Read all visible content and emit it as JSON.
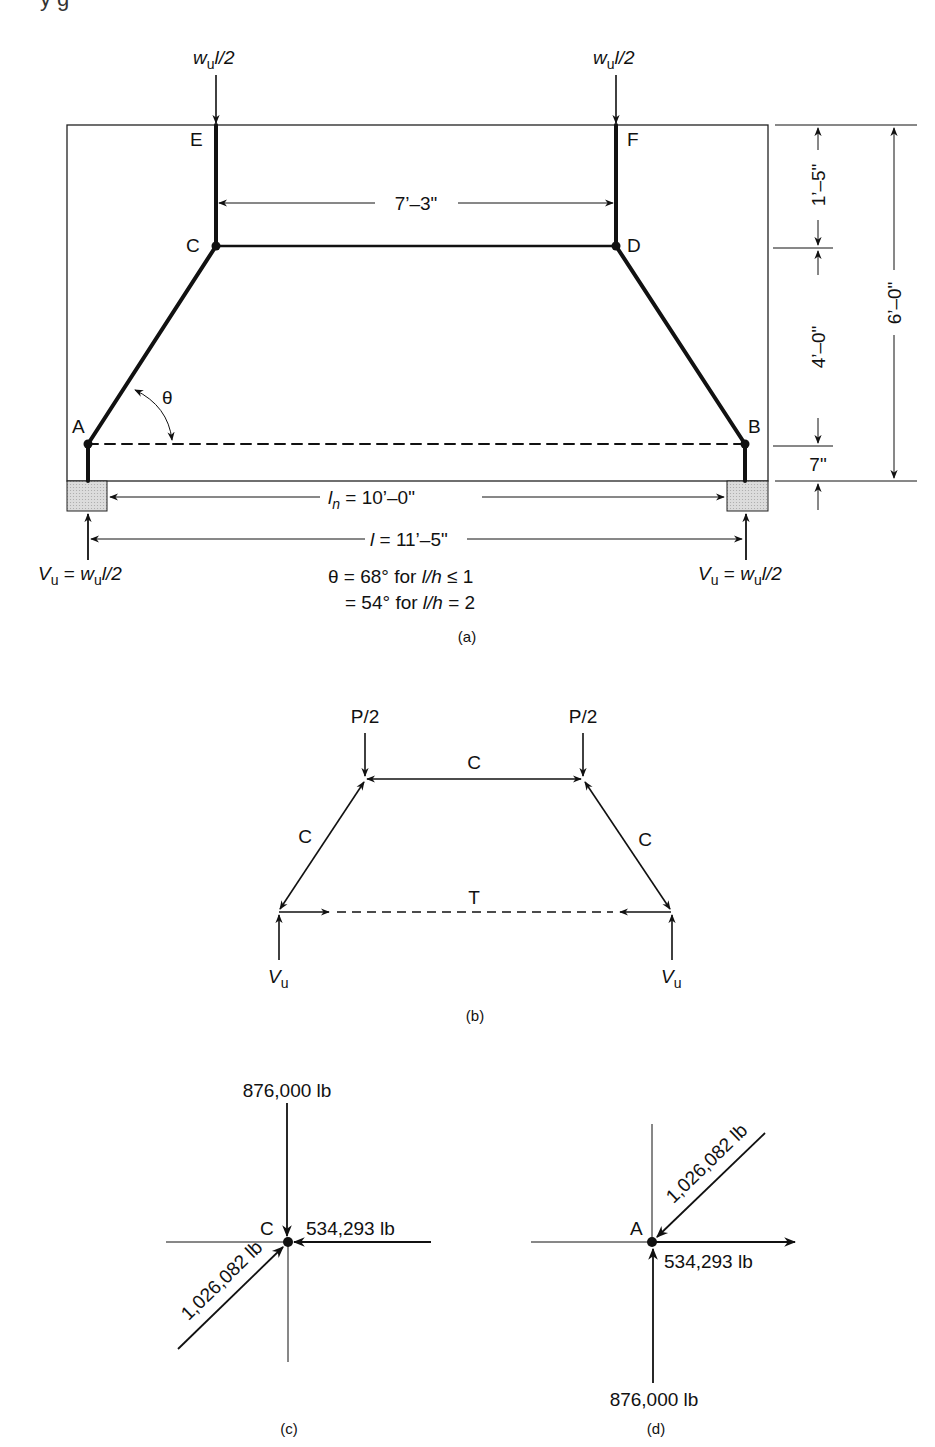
{
  "top_fragment": "y               g",
  "figure_a": {
    "load_left": {
      "w": "w",
      "sub": "u",
      "rest": "l/2"
    },
    "load_right": {
      "w": "w",
      "sub": "u",
      "rest": "l/2"
    },
    "nodes": {
      "E": "E",
      "F": "F",
      "C": "C",
      "D": "D",
      "A": "A",
      "B": "B"
    },
    "theta": "θ",
    "dim_top": "7’–3\"",
    "dim_ln_prefix": "l",
    "dim_ln_sub": "n",
    "dim_ln_value": " = 10’–0\"",
    "dim_l_prefix": "l",
    "dim_l_value": " = 11’–5\"",
    "dim_right_1": "1’–5\"",
    "dim_right_2": "4’–0\"",
    "dim_right_3": "7\"",
    "dim_total": "6’–0\"",
    "reaction_left": {
      "V": "V",
      "sub": "u",
      "eq": " = ",
      "w": "w",
      "wsub": "u",
      "rest": "l/2"
    },
    "reaction_right": {
      "V": "V",
      "sub": "u",
      "eq": " = ",
      "w": "w",
      "wsub": "u",
      "rest": "l/2"
    },
    "theta_note_line1_a": "θ = 68° for  ",
    "theta_note_line1_b": "l/h",
    "theta_note_line1_c": " ≤ 1",
    "theta_note_line2_a": "= 54° for  ",
    "theta_note_line2_b": "l/h",
    "theta_note_line2_c": " = 2",
    "caption": "(a)"
  },
  "figure_b": {
    "load_left": "P/2",
    "load_right": "P/2",
    "strut_top": "C",
    "strut_left": "C",
    "strut_right": "C",
    "tie": "T",
    "reaction_left": {
      "V": "V",
      "sub": "u"
    },
    "reaction_right": {
      "V": "V",
      "sub": "u"
    },
    "caption": "(b)"
  },
  "figure_c": {
    "node": "C",
    "force_vertical": "876,000 lb",
    "force_horizontal": "534,293 lb",
    "force_diagonal": "1,026,082 lb",
    "caption": "(c)"
  },
  "figure_d": {
    "node": "A",
    "force_vertical": "876,000 lb",
    "force_horizontal": "534,293 lb",
    "force_diagonal": "1,026,082 lb",
    "caption": "(d)"
  }
}
